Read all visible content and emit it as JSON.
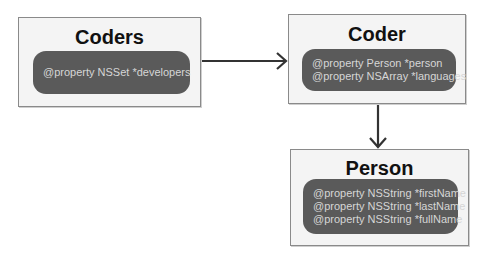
{
  "diagram": {
    "classes": [
      {
        "id": "coders",
        "name": "Coders",
        "properties": [
          "@property NSSet *developers"
        ]
      },
      {
        "id": "coder",
        "name": "Coder",
        "properties": [
          "@property Person *person",
          "@property NSArray *languages"
        ]
      },
      {
        "id": "person",
        "name": "Person",
        "properties": [
          "@property NSString *firstName",
          "@property NSString *lastName",
          "@property NSString *fullName"
        ]
      }
    ],
    "relationships": [
      {
        "from": "Coders",
        "to": "Coder",
        "direction": "right"
      },
      {
        "from": "Coder",
        "to": "Person",
        "direction": "down"
      }
    ]
  },
  "colors": {
    "box_fill": "#f4f4f4",
    "box_border": "#8a8a8a",
    "pill_fill": "#5a5a5a",
    "pill_text": "#d6d6d6",
    "title_text": "#111111",
    "arrow": "#333333"
  }
}
